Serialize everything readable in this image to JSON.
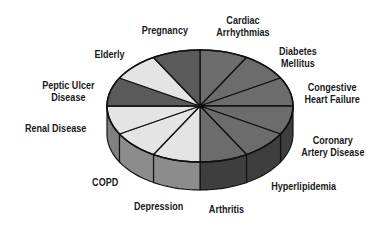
{
  "chart_data": {
    "type": "pie",
    "style": "3d-exploded-none",
    "title": "",
    "categories": [
      "Cardiac Arrhythmias",
      "Diabetes Mellitus",
      "Congestive Heart Failure",
      "Coronary Artery Disease",
      "Hyperlipidemia",
      "Arthritis",
      "Depression",
      "COPD",
      "Renal Disease",
      "Peptic Ulcer Disease",
      "Elderly",
      "Pregnancy"
    ],
    "values": [
      1,
      1,
      1,
      1,
      1,
      1,
      1,
      1,
      1,
      1,
      1,
      1
    ],
    "percent_each": 8.33,
    "legend": "none (labels placed around pie)",
    "colors": {
      "Cardiac Arrhythmias": "#6c6c6c",
      "Diabetes Mellitus": "#6c6c6c",
      "Congestive Heart Failure": "#6c6c6c",
      "Coronary Artery Disease": "#6c6c6c",
      "Hyperlipidemia": "#6c6c6c",
      "Arthritis": "#6c6c6c",
      "Depression": "#e4e4e4",
      "COPD": "#e4e4e4",
      "Renal Disease": "#e4e4e4",
      "Peptic Ulcer Disease": "#5a5a5a",
      "Elderly": "#e4e4e4",
      "Pregnancy": "#5a5a5a"
    },
    "side_colors": {
      "Cardiac Arrhythmias": "#3e3e3e",
      "Diabetes Mellitus": "#3e3e3e",
      "Congestive Heart Failure": "#3e3e3e",
      "Coronary Artery Disease": "#3e3e3e",
      "Hyperlipidemia": "#3e3e3e",
      "Arthritis": "#3e3e3e",
      "Depression": "#8c8c8c",
      "COPD": "#8c8c8c",
      "Renal Disease": "#808080",
      "Peptic Ulcer Disease": "#4a4a4a",
      "Elderly": "#8c8c8c",
      "Pregnancy": "#4a4a4a"
    }
  },
  "labels": {
    "pregnancy": "Pregnancy",
    "cardiac": "Cardiac\nArrhythmias",
    "diabetes": "Diabetes\nMellitus",
    "chf": "Congestive\nHeart Failure",
    "cad": "Coronary\nArtery Disease",
    "hyperlipidemia": "Hyperlipidemia",
    "arthritis": "Arthritis",
    "depression": "Depression",
    "copd": "COPD",
    "renal": "Renal Disease",
    "peptic": "Peptic Ulcer\nDisease",
    "elderly": "Elderly"
  }
}
